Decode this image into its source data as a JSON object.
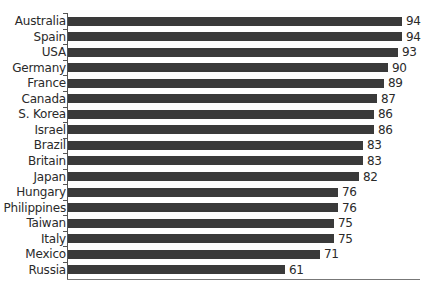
{
  "chart_data": {
    "type": "bar",
    "orientation": "horizontal",
    "title": "",
    "xlabel": "",
    "ylabel": "",
    "categories": [
      "Australia",
      "Spain",
      "USA",
      "Germany",
      "France",
      "Canada",
      "S. Korea",
      "Israel",
      "Brazil",
      "Britain",
      "Japan",
      "Hungary",
      "Philippines",
      "Taiwan",
      "Italy",
      "Mexico",
      "Russia"
    ],
    "values": [
      94,
      94,
      93,
      90,
      89,
      87,
      86,
      86,
      83,
      83,
      82,
      76,
      76,
      75,
      75,
      71,
      61
    ],
    "value_labels": [
      "94",
      "94",
      "93",
      "90",
      "89",
      "87",
      "86",
      "86",
      "83",
      "83",
      "82",
      "76",
      "76",
      "75",
      "75",
      "71",
      "61"
    ],
    "xlim": [
      0,
      100
    ],
    "grid": false,
    "legend": null,
    "bar_color": "#3a3a3a"
  }
}
